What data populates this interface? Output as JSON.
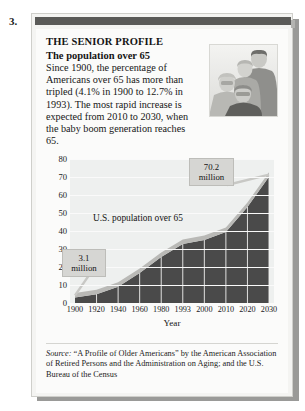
{
  "item_number": "3.",
  "figure": {
    "title": "THE SENIOR PROFILE",
    "subtitle": "The population over 65",
    "body": "Since 1900, the percentage of Americans over 65 has more than tripled (4.1% in 1900 to 12.7% in 1993). The most rapid increase is expected from 2010 to 2030, when the baby boom generation reaches 65.",
    "photo_alt": "family-group-illustration"
  },
  "source": {
    "label": "Source:",
    "text": " “A Profile of Older Americans” by the American Association of Retired Persons and the Administration on Aging; and the U.S. Bureau of the Census"
  },
  "callouts": {
    "low": "3.1 million",
    "high": "70.2 million"
  },
  "colors": {
    "header_bar": "#5a5a58",
    "area_fill": "#4a4a4a",
    "ribbon": "#b9b9b6",
    "plot_bg": "#eef0ef",
    "callout_bg": "#d6d6d3"
  },
  "chart_data": {
    "type": "area",
    "title": "",
    "xlabel": "Year",
    "ylabel": "",
    "series_label": "U.S. population over 65",
    "categories": [
      "1900",
      "1920",
      "1940",
      "1960",
      "1980",
      "1993",
      "2000",
      "2010",
      "2020",
      "2030"
    ],
    "values": [
      3.1,
      4.9,
      9.0,
      16.6,
      25.5,
      32.8,
      35.0,
      39.4,
      53.3,
      70.2
    ],
    "ylim": [
      0,
      80
    ],
    "yticks": [
      0,
      10,
      20,
      30,
      40,
      50,
      60,
      70,
      80
    ],
    "grid": true,
    "legend": "none",
    "annotations": [
      {
        "label": "3.1 million",
        "x": "1900",
        "y": 3.1
      },
      {
        "label": "70.2 million",
        "x": "2030",
        "y": 70.2
      }
    ],
    "units": "millions of people"
  }
}
